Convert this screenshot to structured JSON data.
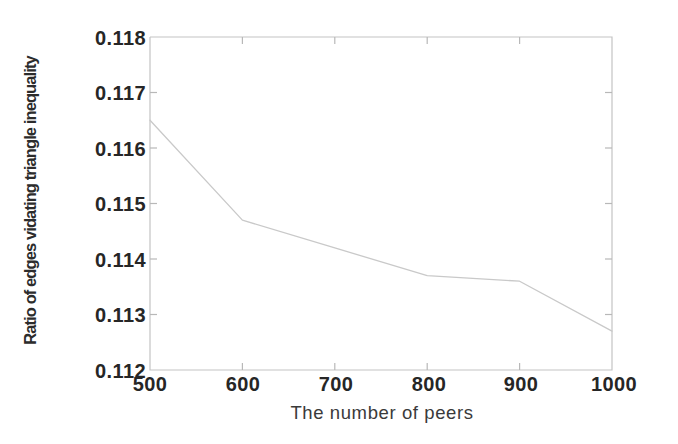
{
  "chart_data": {
    "type": "line",
    "title": "",
    "xlabel": "The number of peers",
    "ylabel": "Ratio of edges vidating triangle inequality",
    "x": [
      500,
      600,
      700,
      800,
      900,
      1000
    ],
    "values": [
      0.1165,
      0.1147,
      0.1142,
      0.1137,
      0.1136,
      0.1127
    ],
    "categories": [
      "500",
      "600",
      "700",
      "800",
      "900",
      "1000"
    ],
    "xlim": [
      500,
      1000
    ],
    "ylim": [
      0.112,
      0.118
    ],
    "xticks": [
      "500",
      "600",
      "700",
      "800",
      "900",
      "1000"
    ],
    "yticks": [
      "0.112",
      "0.113",
      "0.114",
      "0.115",
      "0.116",
      "0.117",
      "0.118"
    ],
    "grid": false,
    "legend": null,
    "series": [
      {
        "name": "Ratio of edges vidating triangle inequality",
        "values": [
          0.1165,
          0.1147,
          0.1142,
          0.1137,
          0.1136,
          0.1127
        ]
      }
    ],
    "line_color": "#c9c9c9",
    "axis_color": "#c4c4c4"
  },
  "axis": {
    "y_tick_labels": [
      "0.118",
      "0.117",
      "0.116",
      "0.115",
      "0.114",
      "0.113",
      "0.112"
    ],
    "x_tick_labels": [
      "500",
      "600",
      "700",
      "800",
      "900",
      "1000"
    ],
    "y_title": "Ratio of edges vidating triangle inequality",
    "x_title": "The number of peers"
  }
}
